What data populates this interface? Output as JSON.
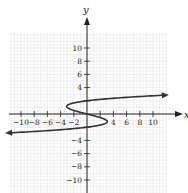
{
  "chart_data": {
    "type": "line",
    "title": "",
    "xlabel": "x",
    "ylabel": "y",
    "xlim": [
      -12,
      12
    ],
    "ylim": [
      -12,
      12
    ],
    "grid": true,
    "x_ticks": [
      -10,
      -8,
      -6,
      -4,
      -2,
      4,
      6,
      8,
      10
    ],
    "x_tick_labels": [
      "−10",
      "−8",
      "−6",
      "−4",
      "−2",
      "4",
      "6",
      "8",
      "10"
    ],
    "y_ticks": [
      10,
      8,
      6,
      4,
      -4,
      -6,
      -8,
      -10
    ],
    "y_tick_labels": [
      "10",
      "8",
      "6",
      "4",
      "−4",
      "−6",
      "−8",
      "−10"
    ],
    "series": [
      {
        "name": "curve",
        "equation": "x = y^3 - 4y",
        "arrows_at_ends": true,
        "points": [
          {
            "x": -11.8,
            "y": -2.85
          },
          {
            "x": 0,
            "y": -2
          },
          {
            "x": 3.1,
            "y": -1.15
          },
          {
            "x": 0,
            "y": 0
          },
          {
            "x": -3.1,
            "y": 1.15
          },
          {
            "x": 0,
            "y": 2
          },
          {
            "x": 11.8,
            "y": 2.85
          }
        ]
      }
    ],
    "colors": {
      "curve": "#333333",
      "axes": "#222222",
      "grid": "#e2e2e2"
    }
  }
}
